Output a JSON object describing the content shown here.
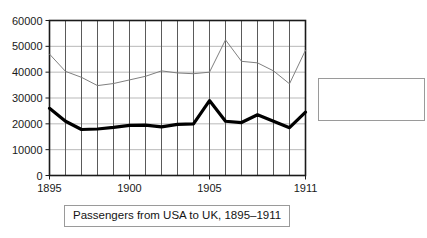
{
  "chart_data": {
    "type": "line",
    "title": "",
    "xlabel": "",
    "ylabel": "",
    "x": [
      1895,
      1896,
      1897,
      1898,
      1899,
      1900,
      1901,
      1902,
      1903,
      1904,
      1905,
      1906,
      1907,
      1908,
      1909,
      1910,
      1911
    ],
    "xlim": [
      1895,
      1911
    ],
    "ylim": [
      0,
      60000
    ],
    "grid": true,
    "legend_position": "outside-right",
    "y_ticks": [
      0,
      10000,
      20000,
      30000,
      40000,
      50000,
      60000
    ],
    "y_tick_labels": [
      "0",
      "10000",
      "20000",
      "30000",
      "40000",
      "50000",
      "60000"
    ],
    "x_ticks": [
      1895,
      1900,
      1905,
      1911
    ],
    "x_tick_labels": [
      "1895",
      "1900",
      "1905",
      "1911"
    ],
    "series": [
      {
        "name": "Irish Arrivals",
        "color": "#000000",
        "width": 3.2,
        "values": [
          26000,
          21000,
          17800,
          18000,
          18600,
          19400,
          19500,
          18800,
          19800,
          20000,
          29000,
          21000,
          20500,
          23500,
          21000,
          18500,
          24500
        ]
      },
      {
        "name": "British Arrivals",
        "color": "#808080",
        "width": 1,
        "values": [
          47000,
          40300,
          38000,
          34800,
          35600,
          37000,
          38400,
          40500,
          39700,
          39400,
          40000,
          52500,
          44200,
          43600,
          40500,
          35500,
          48500
        ]
      }
    ]
  },
  "legend": {
    "entries": [
      {
        "label": "Irish Arrivals"
      },
      {
        "label": "British Arrivals"
      }
    ]
  },
  "caption": {
    "text": "Passengers from USA to UK, 1895–1911"
  },
  "colors": {
    "irish": "#000000",
    "british": "#808080",
    "gridline": "#b9b9b9",
    "axis": "#1a1a1a",
    "border": "#9a9a9a",
    "background": "#ffffff"
  }
}
